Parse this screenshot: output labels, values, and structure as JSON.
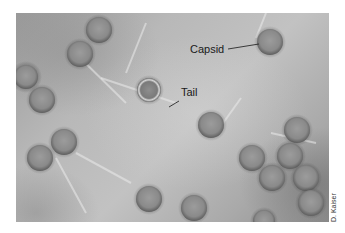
{
  "figure": {
    "labels": {
      "capsid": "Capsid",
      "tail": "Tail"
    },
    "credit": "D. Kaiser",
    "colors": {
      "background": "#ffffff",
      "label_text": "#1a1a1a",
      "leader_line": "#2a2a2a"
    }
  }
}
